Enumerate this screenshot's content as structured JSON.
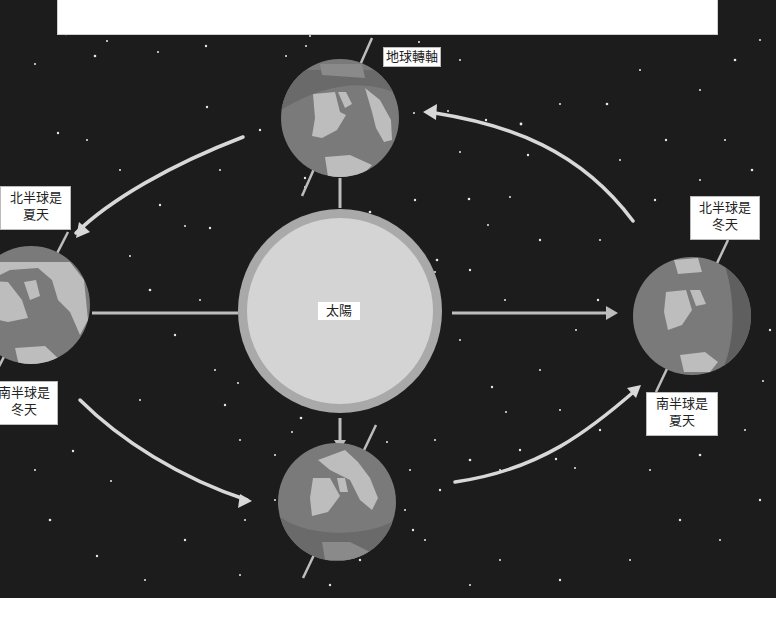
{
  "caption": {
    "text": "",
    "note": "caption text cut off at top edge; not legible"
  },
  "diagram": {
    "sun": {
      "label": "太陽",
      "color_core": "#d4d4d4",
      "color_halo": "#a9a9a9"
    },
    "axis_label": "地球轉軸",
    "positions": [
      {
        "id": "top",
        "note": ""
      },
      {
        "id": "left",
        "north_label": "北半球是\n夏天",
        "south_label": "南半球是\n冬天"
      },
      {
        "id": "bottom",
        "note": ""
      },
      {
        "id": "right",
        "north_label": "北半球是\n冬天",
        "south_label": "南半球是\n夏天"
      }
    ],
    "labels": {
      "axis": "地球轉軸",
      "left_north_line1": "北半球是",
      "left_north_line2": "夏天",
      "left_south_line1": "南半球是",
      "left_south_line2": "冬天",
      "right_north_line1": "北半球是",
      "right_north_line2": "冬天",
      "right_south_line1": "南半球是",
      "right_south_line2": "夏天",
      "sun": "太陽"
    },
    "colors": {
      "space": "#1c1c1c",
      "earth_ocean": "#7a7a7a",
      "earth_land": "#bdbdbd",
      "earth_shadow": "#5f5f5f",
      "arrow": "#d8d8d8"
    }
  }
}
